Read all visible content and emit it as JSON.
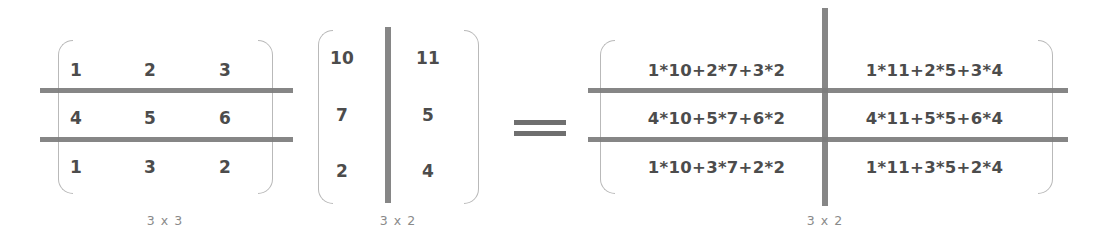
{
  "diagram": {
    "operator": "=",
    "dimension_separator": "x",
    "ink_color": "#4c4c4c",
    "rule_color": "#7d7d7d",
    "bracket_color": "#b9b9b9",
    "label_color": "#8a8a8a",
    "background": "#ffffff"
  },
  "matrix_a": {
    "name": "Matrix A",
    "rows": 3,
    "cols": 3,
    "dimension_label": "3 x 3",
    "values": [
      [
        "1",
        "2",
        "3"
      ],
      [
        "4",
        "5",
        "6"
      ],
      [
        "1",
        "3",
        "2"
      ]
    ]
  },
  "matrix_b": {
    "name": "Matrix B",
    "rows": 3,
    "cols": 2,
    "dimension_label": "3 x 2",
    "values": [
      [
        "10",
        "11"
      ],
      [
        "7",
        "5"
      ],
      [
        "2",
        "4"
      ]
    ]
  },
  "matrix_result": {
    "name": "Result Matrix",
    "rows": 3,
    "cols": 2,
    "dimension_label": "3 x 2",
    "values": [
      [
        "1*10+2*7+3*2",
        "1*11+2*5+3*4"
      ],
      [
        "4*10+5*7+6*2",
        "4*11+5*5+6*4"
      ],
      [
        "1*10+3*7+2*2",
        "1*11+3*5+2*4"
      ]
    ]
  }
}
